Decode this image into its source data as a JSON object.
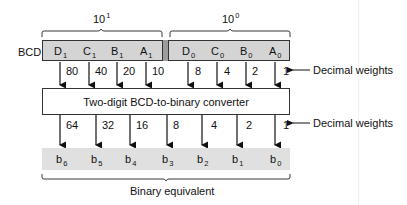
{
  "diagram": {
    "bcd_label": "BCD",
    "tens_label_base": "10",
    "tens_label_exp": "1",
    "units_label_base": "10",
    "units_label_exp": "0",
    "bcd_bits": [
      {
        "letter": "D",
        "sub": "1",
        "weight": "80"
      },
      {
        "letter": "C",
        "sub": "1",
        "weight": "40"
      },
      {
        "letter": "B",
        "sub": "1",
        "weight": "20"
      },
      {
        "letter": "A",
        "sub": "1",
        "weight": "10"
      },
      {
        "letter": "D",
        "sub": "0",
        "weight": "8"
      },
      {
        "letter": "C",
        "sub": "0",
        "weight": "4"
      },
      {
        "letter": "B",
        "sub": "0",
        "weight": "2"
      },
      {
        "letter": "A",
        "sub": "0",
        "weight": "1"
      }
    ],
    "converter_label": "Two-digit BCD-to-binary converter",
    "decimal_weights_label_top": "Decimal weights",
    "decimal_weights_label_bottom": "Decimal weights",
    "binary_bits": [
      {
        "letter": "b",
        "sub": "6",
        "weight": "64"
      },
      {
        "letter": "b",
        "sub": "5",
        "weight": "32"
      },
      {
        "letter": "b",
        "sub": "4",
        "weight": "16"
      },
      {
        "letter": "b",
        "sub": "3",
        "weight": "8"
      },
      {
        "letter": "b",
        "sub": "2",
        "weight": "4"
      },
      {
        "letter": "b",
        "sub": "1",
        "weight": "2"
      },
      {
        "letter": "b",
        "sub": "0",
        "weight": "1"
      }
    ],
    "binary_label": "Binary equivalent",
    "colors": {
      "bcd_fill": "#d4d4d4",
      "divider_fill": "#9c9c9c",
      "binary_fill": "#e0e0e0",
      "stroke": "#333333"
    }
  }
}
